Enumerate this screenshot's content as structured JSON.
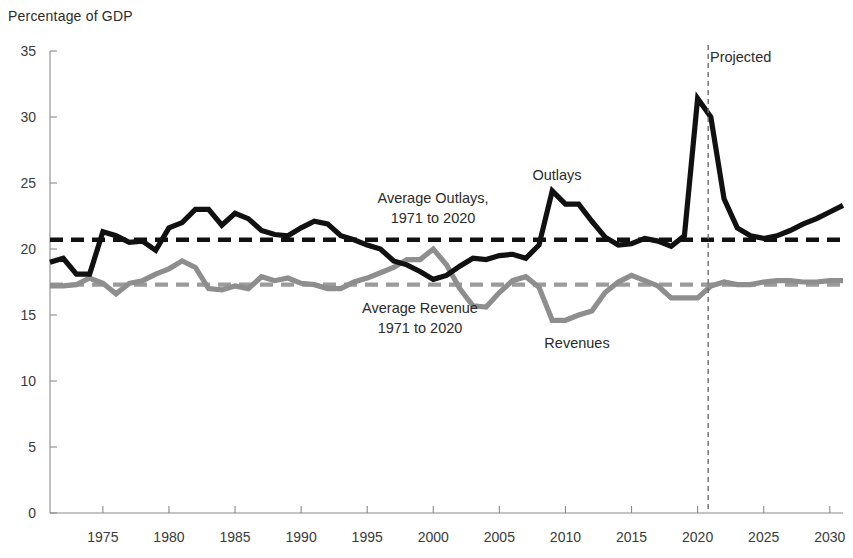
{
  "chart": {
    "axis_title": "Percentage of GDP"
  },
  "annotations": {
    "outlays_label": "Outlays",
    "revenues_label": "Revenues",
    "avg_outlays_line1": "Average Outlays,",
    "avg_outlays_line2": "1971 to 2020",
    "avg_revenue_line1": "Average Revenue",
    "avg_revenue_line2": "1971 to 2020",
    "projected_label": "Projected"
  },
  "colors": {
    "outlays": "#111111",
    "revenues": "#8e8e8e",
    "avg_outlays": "#111111",
    "avg_revenue": "#9b9b9b",
    "axis": "#8a8a8a",
    "text": "#2b2b2b",
    "background": "#ffffff"
  },
  "chart_data": {
    "type": "line",
    "title": "",
    "subtitle": "",
    "xlabel": "",
    "ylabel": "Percentage of GDP",
    "xlim": [
      1971,
      2031
    ],
    "ylim": [
      0,
      35
    ],
    "yticks": [
      0,
      5,
      10,
      15,
      20,
      25,
      30,
      35
    ],
    "ytick_labels": [
      "0",
      "5",
      "10",
      "15",
      "20",
      "25",
      "30",
      "35"
    ],
    "xticks": [
      1975,
      1980,
      1985,
      1990,
      1995,
      2000,
      2005,
      2010,
      2015,
      2020,
      2025,
      2030
    ],
    "xtick_labels": [
      "1975",
      "1980",
      "1985",
      "1990",
      "1995",
      "2000",
      "2005",
      "2010",
      "2015",
      "2020",
      "2025",
      "2030"
    ],
    "grid": false,
    "legend": "annotations-inline",
    "x": [
      1971,
      1972,
      1973,
      1974,
      1975,
      1976,
      1977,
      1978,
      1979,
      1980,
      1981,
      1982,
      1983,
      1984,
      1985,
      1986,
      1987,
      1988,
      1989,
      1990,
      1991,
      1992,
      1993,
      1994,
      1995,
      1996,
      1997,
      1998,
      1999,
      2000,
      2001,
      2002,
      2003,
      2004,
      2005,
      2006,
      2007,
      2008,
      2009,
      2010,
      2011,
      2012,
      2013,
      2014,
      2015,
      2016,
      2017,
      2018,
      2019,
      2020,
      2021,
      2022,
      2023,
      2024,
      2025,
      2026,
      2027,
      2028,
      2029,
      2030,
      2031
    ],
    "series": [
      {
        "name": "Outlays",
        "color": "#111111",
        "style": "solid",
        "values": [
          19.0,
          19.3,
          18.1,
          18.1,
          21.3,
          21.0,
          20.5,
          20.6,
          19.9,
          21.6,
          22.0,
          23.0,
          23.0,
          21.8,
          22.7,
          22.3,
          21.4,
          21.1,
          21.0,
          21.6,
          22.1,
          21.9,
          21.0,
          20.7,
          20.3,
          20.0,
          19.1,
          18.8,
          18.3,
          17.7,
          18.0,
          18.7,
          19.3,
          19.2,
          19.5,
          19.6,
          19.3,
          20.3,
          24.4,
          23.4,
          23.4,
          22.1,
          20.9,
          20.3,
          20.4,
          20.8,
          20.6,
          20.2,
          21.0,
          31.4,
          30.0,
          23.8,
          21.6,
          21.0,
          20.8,
          21.0,
          21.4,
          21.9,
          22.3,
          22.8,
          23.3
        ]
      },
      {
        "name": "Revenues",
        "color": "#8e8e8e",
        "style": "solid",
        "values": [
          17.2,
          17.2,
          17.3,
          17.8,
          17.4,
          16.6,
          17.4,
          17.6,
          18.1,
          18.5,
          19.1,
          18.6,
          17.0,
          16.9,
          17.2,
          17.0,
          17.9,
          17.6,
          17.8,
          17.4,
          17.3,
          17.0,
          17.0,
          17.5,
          17.8,
          18.2,
          18.6,
          19.2,
          19.2,
          20.0,
          18.8,
          17.0,
          15.7,
          15.6,
          16.7,
          17.6,
          17.9,
          17.1,
          14.6,
          14.6,
          15.0,
          15.3,
          16.7,
          17.5,
          18.0,
          17.6,
          17.2,
          16.3,
          16.3,
          16.3,
          17.2,
          17.5,
          17.3,
          17.3,
          17.5,
          17.6,
          17.6,
          17.5,
          17.5,
          17.6,
          17.6
        ]
      }
    ],
    "reference_lines": [
      {
        "name": "Average Outlays, 1971 to 2020",
        "value": 20.7,
        "orientation": "horizontal",
        "style": "dashed",
        "color": "#111111",
        "x_start": 1971,
        "x_end": 2031
      },
      {
        "name": "Average Revenue, 1971 to 2020",
        "value": 17.3,
        "orientation": "horizontal",
        "style": "dashed",
        "color": "#9b9b9b",
        "x_start": 1971,
        "x_end": 2031
      },
      {
        "name": "Projected",
        "value": 2020.8,
        "orientation": "vertical",
        "style": "dashed",
        "color": "#6e6e6e"
      }
    ]
  }
}
